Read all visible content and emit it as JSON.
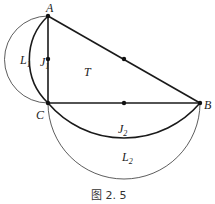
{
  "figure": {
    "caption": "图 2. 5",
    "points": {
      "A": {
        "label": "A",
        "x": 48,
        "y": 16
      },
      "C": {
        "label": "C",
        "x": 48,
        "y": 103
      },
      "B": {
        "label": "B",
        "x": 200,
        "y": 103
      }
    },
    "midpoints": [
      {
        "of": "AB",
        "x": 124,
        "y": 59
      },
      {
        "of": "AC",
        "x": 48,
        "y": 59
      },
      {
        "of": "CB",
        "x": 124,
        "y": 103
      }
    ],
    "regions": {
      "L1": {
        "base": "L",
        "sub": "1"
      },
      "J1": {
        "base": "J",
        "sub": "1"
      },
      "T": {
        "base": "T"
      },
      "J2": {
        "base": "J",
        "sub": "2"
      },
      "L2": {
        "base": "L",
        "sub": "2"
      }
    },
    "colors": {
      "stroke": "#1a1a1a",
      "thin": "#333333",
      "background": "#ffffff"
    }
  }
}
